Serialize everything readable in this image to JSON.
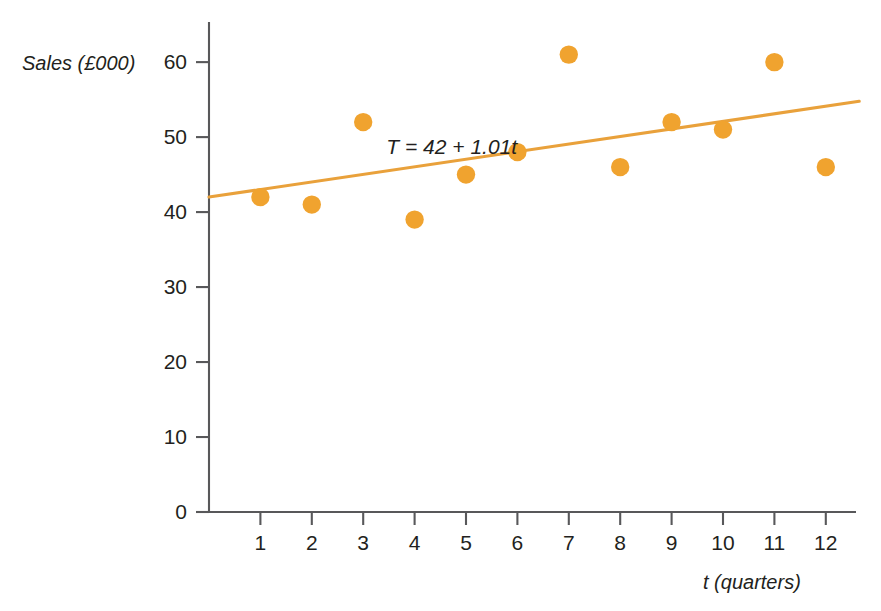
{
  "chart_data": {
    "type": "scatter",
    "title": "",
    "xlabel": "t (quarters)",
    "ylabel": "Sales (£000)",
    "x": [
      1,
      2,
      3,
      4,
      5,
      6,
      7,
      8,
      9,
      10,
      11,
      12
    ],
    "values": [
      42,
      41,
      52,
      39,
      45,
      48,
      61,
      46,
      52,
      51,
      60,
      46
    ],
    "series": [
      {
        "name": "Sales",
        "values": [
          42,
          41,
          52,
          39,
          45,
          48,
          61,
          46,
          52,
          51,
          60,
          46
        ]
      }
    ],
    "xlim": [
      0,
      12.9
    ],
    "ylim": [
      0,
      65
    ],
    "xticks": [
      "1",
      "2",
      "3",
      "4",
      "5",
      "6",
      "7",
      "8",
      "9",
      "10",
      "11",
      "12"
    ],
    "yticks": [
      "0",
      "10",
      "20",
      "30",
      "40",
      "50",
      "60"
    ],
    "grid": false,
    "legend": null,
    "annotations": [
      {
        "text": "T = 42 + 1.01t",
        "x": 3.45,
        "y": 47.8
      }
    ],
    "trendline": {
      "label": "T = 42 + 1.01t",
      "intercept": 42,
      "slope": 1.01,
      "x_start": 0,
      "x_end": 12.65
    },
    "colors": {
      "marker": "#f0a32f",
      "trendline": "#e9a13b",
      "axis": "#58585a",
      "text": "#231f20"
    }
  }
}
